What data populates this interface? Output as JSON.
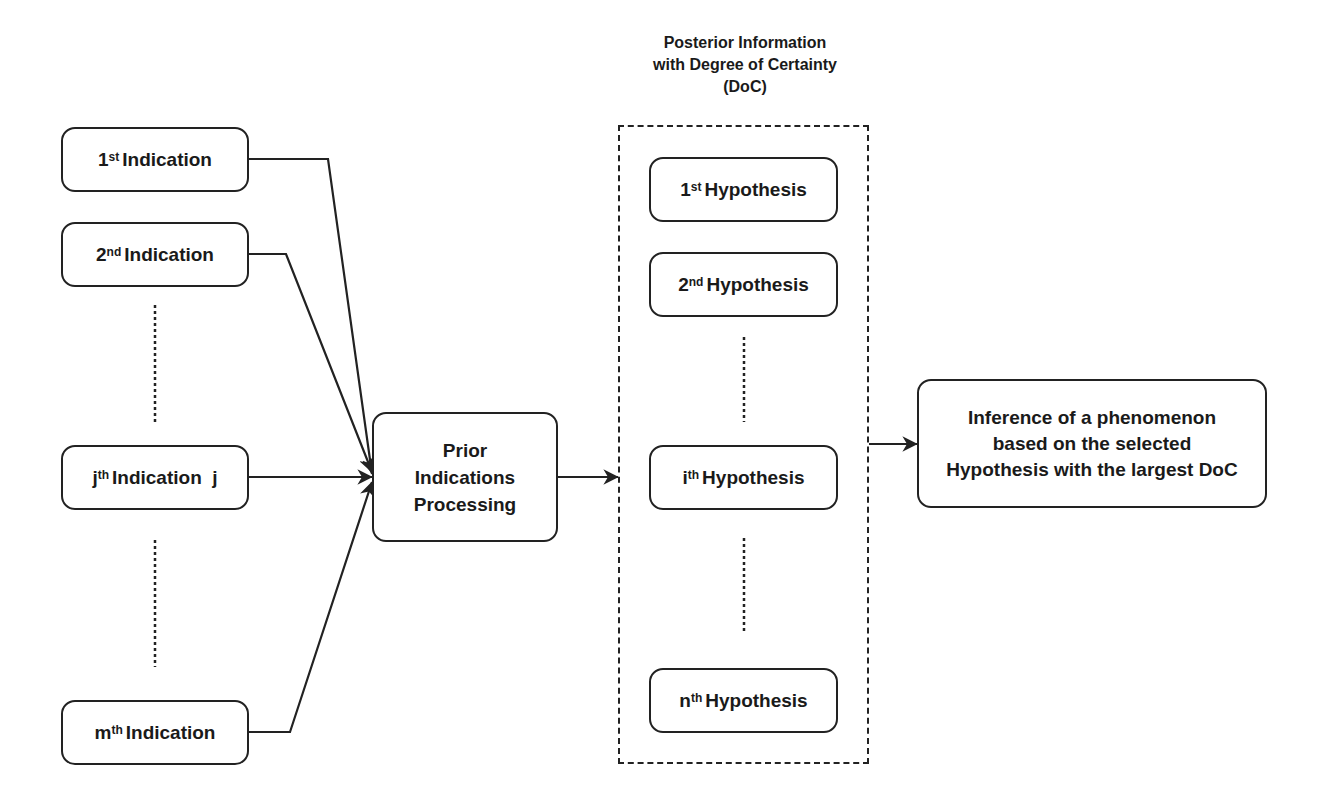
{
  "diagram": {
    "container_title": [
      "Posterior Information",
      "with Degree of Certainty",
      "(DoC)"
    ],
    "indications": [
      {
        "ordinal": "1",
        "suffix": "st",
        "label": "Indication"
      },
      {
        "ordinal": "2",
        "suffix": "nd",
        "label": "Indication"
      },
      {
        "ordinal": "j",
        "suffix": "th",
        "label": "Indication  j"
      },
      {
        "ordinal": "m",
        "suffix": "th",
        "label": "Indication"
      }
    ],
    "processing": [
      "Prior",
      "Indications",
      "Processing"
    ],
    "hypotheses": [
      {
        "ordinal": "1",
        "suffix": "st",
        "label": "Hypothesis"
      },
      {
        "ordinal": "2",
        "suffix": "nd",
        "label": "Hypothesis"
      },
      {
        "ordinal": "i",
        "suffix": "th",
        "label": "Hypothesis"
      },
      {
        "ordinal": "n",
        "suffix": "th",
        "label": "Hypothesis"
      }
    ],
    "inference": [
      "Inference of a phenomenon",
      "based on the selected",
      "Hypothesis with the largest DoC"
    ],
    "colors": {
      "stroke": "#222222",
      "background": "#ffffff",
      "text": "#1a1a1a"
    }
  }
}
